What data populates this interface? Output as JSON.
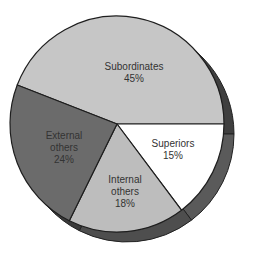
{
  "chart_data": {
    "type": "pie",
    "title": "",
    "slices": [
      {
        "label_lines": [
          "Subordinates",
          "45%"
        ],
        "name": "Subordinates",
        "value": 45,
        "color": "#c6c6c6"
      },
      {
        "label_lines": [
          "Superiors",
          "15%"
        ],
        "name": "Superiors",
        "value": 15,
        "color": "#ffffff"
      },
      {
        "label_lines": [
          "Internal",
          "others",
          "18%"
        ],
        "name": "Internal others",
        "value": 18,
        "color": "#bdbdbd"
      },
      {
        "label_lines": [
          "External",
          "others",
          "24%"
        ],
        "name": "External others",
        "value": 24,
        "color": "#6b6b6b"
      }
    ],
    "rim_colors": {
      "Subordinates": "#3f3f3f",
      "Superiors": "#5a5a5a",
      "Internal others": "#4e4e4e",
      "External others": "#3a3a3a"
    },
    "legend": "none",
    "style": "3d-tilted"
  }
}
